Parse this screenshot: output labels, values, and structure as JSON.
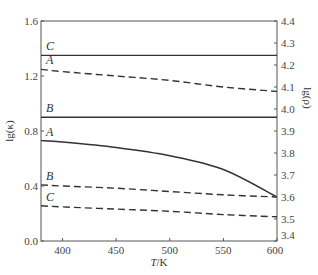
{
  "chart_data": {
    "type": "line",
    "title": "",
    "xlabel": "T/K",
    "ylabel_left": "lg(κ)",
    "ylabel_right": "lg(ρ)",
    "xlim": [
      380,
      600
    ],
    "ylim_left": [
      0.0,
      1.6
    ],
    "ylim_right": [
      3.4,
      4.4
    ],
    "x_ticks": [
      400,
      450,
      500,
      550,
      600
    ],
    "y_ticks_left": [
      "0.0",
      "0.4",
      "0.8",
      "1.2",
      "1.6"
    ],
    "y_ticks_right": [
      "3.4",
      "3.5",
      "3.6",
      "3.7",
      "3.8",
      "3.9",
      "4.0",
      "4.1",
      "4.2",
      "4.3",
      "4.4"
    ],
    "grid": false,
    "legend": "inline curve labels at left edge",
    "x": [
      380,
      400,
      450,
      500,
      550,
      600
    ],
    "series": [
      {
        "name": "C",
        "style": "solid",
        "axis": "left",
        "label": "C",
        "values": [
          1.35,
          1.35,
          1.35,
          1.35,
          1.35,
          1.35
        ]
      },
      {
        "name": "A",
        "style": "dashed",
        "axis": "right",
        "label": "A",
        "values": [
          4.18,
          4.17,
          4.15,
          4.13,
          4.1,
          4.08
        ]
      },
      {
        "name": "B",
        "style": "solid",
        "axis": "left",
        "label": "B",
        "values": [
          0.9,
          0.9,
          0.9,
          0.9,
          0.9,
          0.9
        ]
      },
      {
        "name": "A",
        "style": "solid",
        "axis": "left",
        "label": "A",
        "values": [
          0.73,
          0.72,
          0.68,
          0.62,
          0.52,
          0.32
        ]
      },
      {
        "name": "B",
        "style": "dashed",
        "axis": "right",
        "label": "B",
        "values": [
          3.655,
          3.65,
          3.64,
          3.625,
          3.61,
          3.6
        ]
      },
      {
        "name": "C",
        "style": "dashed",
        "axis": "right",
        "label": "C",
        "values": [
          3.56,
          3.555,
          3.545,
          3.535,
          3.52,
          3.51
        ]
      }
    ]
  }
}
